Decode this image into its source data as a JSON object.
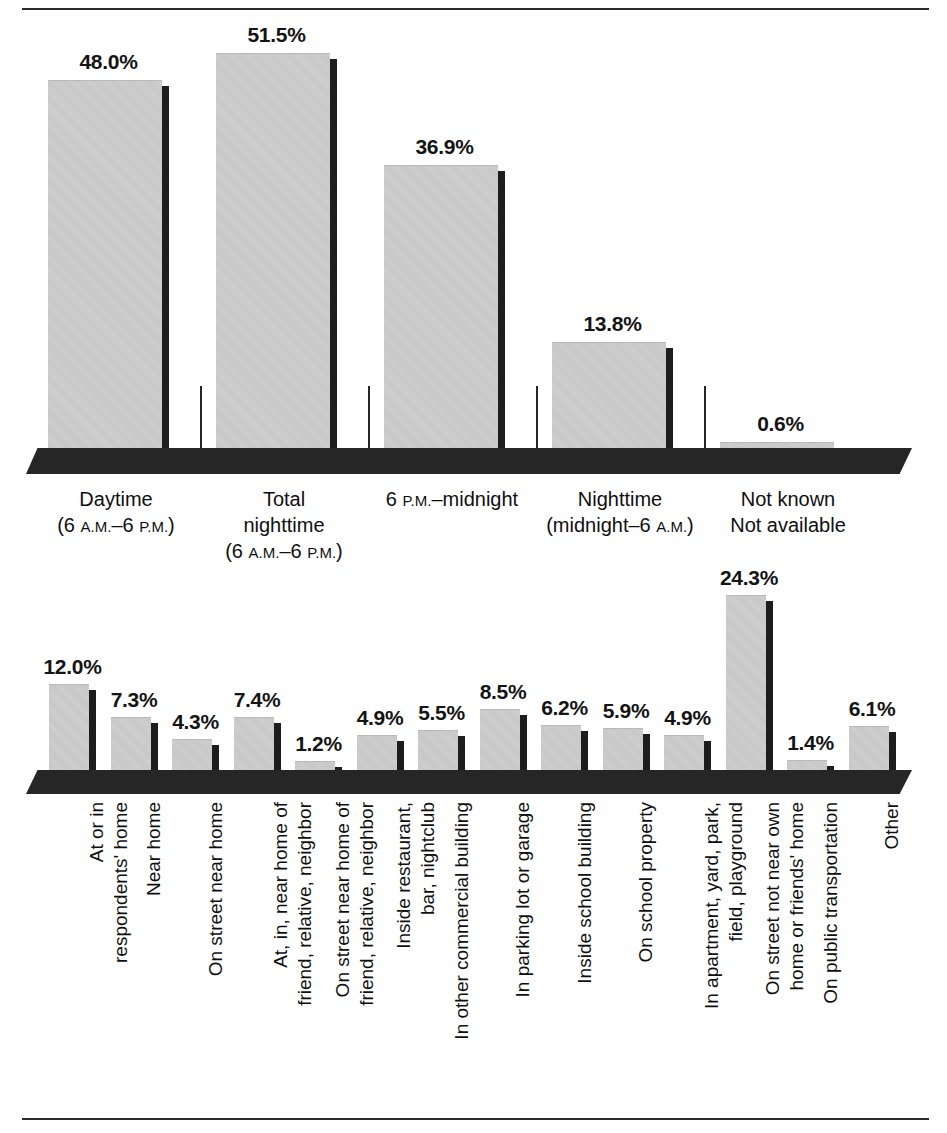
{
  "page": {
    "top_rule": true,
    "bottom_rule": true,
    "background_color": "#ffffff",
    "bar_fill_color": "#cacaca",
    "bar_shadow_color": "#1d1d1d",
    "baseline_color": "#262626",
    "text_color": "#111111"
  },
  "chart_data": [
    {
      "id": "time-of-incident",
      "type": "bar",
      "title": "",
      "xlabel": "",
      "ylabel": "",
      "ylim": [
        0,
        55
      ],
      "grid": false,
      "legend": "none",
      "categories": [
        "Daytime (6 A.M.–6 P.M.)",
        "Total nighttime (6 A.M.–6 P.M.)",
        "6 P.M.–midnight",
        "Nighttime (midnight–6 A.M.)",
        "Not known Not available"
      ],
      "category_lines": [
        [
          "Daytime",
          "(6 A.M.–6 P.M.)"
        ],
        [
          "Total",
          "nighttime",
          "(6 A.M.–6 P.M.)"
        ],
        [
          "6 P.M.–midnight"
        ],
        [
          "Nighttime",
          "(midnight–6 A.M.)"
        ],
        [
          "Not known",
          "Not available"
        ]
      ],
      "values": [
        48.0,
        51.5,
        36.9,
        13.8,
        0.6
      ],
      "value_labels": [
        "48.0%",
        "51.5%",
        "36.9%",
        "13.8%",
        "0.6%"
      ]
    },
    {
      "id": "place-of-incident",
      "type": "bar",
      "title": "",
      "xlabel": "",
      "ylabel": "",
      "ylim": [
        0,
        26
      ],
      "grid": false,
      "legend": "none",
      "categories": [
        "At or in respondents' home",
        "Near home",
        "On street near home",
        "At, in, near home of friend, relative, neighbor",
        "On street near home of friend, relative, neighbor",
        "Inside restaurant, bar, nightclub",
        "In other commercial building",
        "In parking lot or garage",
        "Inside school building",
        "On school property",
        "In apartment, yard, park, field, playground",
        "On street not near own home or friends' home",
        "On public transportation",
        "Other"
      ],
      "category_lines": [
        [
          "At or in",
          "respondents' home"
        ],
        [
          "Near home"
        ],
        [
          "On street near home"
        ],
        [
          "At, in, near home of",
          "friend, relative, neighbor"
        ],
        [
          "On street near home of",
          "friend, relative, neighbor"
        ],
        [
          "Inside restaurant,",
          "bar, nightclub"
        ],
        [
          "In other commercial building"
        ],
        [
          "In parking lot or garage"
        ],
        [
          "Inside school building"
        ],
        [
          "On school property"
        ],
        [
          "In apartment, yard, park,",
          "field, playground"
        ],
        [
          "On street not near own",
          "home or friends' home"
        ],
        [
          "On public transportation"
        ],
        [
          "Other"
        ]
      ],
      "values": [
        12.0,
        7.3,
        4.3,
        7.4,
        1.2,
        4.9,
        5.5,
        8.5,
        6.2,
        5.9,
        4.9,
        24.3,
        1.4,
        6.1
      ],
      "value_labels": [
        "12.0%",
        "7.3%",
        "4.3%",
        "7.4%",
        "1.2%",
        "4.9%",
        "5.5%",
        "8.5%",
        "6.2%",
        "5.9%",
        "4.9%",
        "24.3%",
        "1.4%",
        "6.1%"
      ]
    }
  ]
}
